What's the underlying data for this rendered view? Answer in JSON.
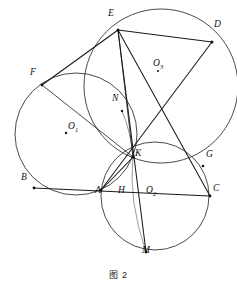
{
  "figure": {
    "caption": "图 2",
    "width": 237,
    "height": 289,
    "background_color": "#ffffff",
    "stroke_color": "#1a1a1a",
    "circle_stroke_color": "#2b2b2b"
  },
  "circles": [
    {
      "name": "O1",
      "label": "O",
      "subscript": "1",
      "cx": 76,
      "cy": 134,
      "r": 61,
      "label_x": 68,
      "label_y": 129,
      "has_center_dot": true
    },
    {
      "name": "O2",
      "label": "O",
      "subscript": "2",
      "cx": 155,
      "cy": 196,
      "r": 54,
      "label_x": 146,
      "label_y": 193,
      "has_center_dot": false
    },
    {
      "name": "O3",
      "label": "O",
      "subscript": "3",
      "cx": 161,
      "cy": 86,
      "r": 77,
      "label_x": 153,
      "label_y": 66,
      "has_center_dot": false
    }
  ],
  "points": [
    {
      "name": "E",
      "label": "E",
      "x": 118,
      "y": 30,
      "label_x": 108,
      "label_y": 17
    },
    {
      "name": "D",
      "label": "D",
      "x": 212,
      "y": 42,
      "label_x": 214,
      "label_y": 28
    },
    {
      "name": "F",
      "label": "F",
      "x": 42,
      "y": 85,
      "label_x": 30,
      "label_y": 76
    },
    {
      "name": "N",
      "label": "N",
      "x": 122,
      "y": 111,
      "label_x": 112,
      "label_y": 102
    },
    {
      "name": "K",
      "label": "K",
      "x": 133,
      "y": 157,
      "label_x": 135,
      "label_y": 157
    },
    {
      "name": "G",
      "label": "G",
      "x": 203,
      "y": 166,
      "label_x": 206,
      "label_y": 158
    },
    {
      "name": "B",
      "label": "B",
      "x": 34,
      "y": 188,
      "label_x": 21,
      "label_y": 181
    },
    {
      "name": "A",
      "label": "A",
      "x": 101,
      "y": 190,
      "label_x": 95,
      "label_y": 194
    },
    {
      "name": "H",
      "label": "H",
      "x": 122,
      "y": 192,
      "label_x": 118,
      "label_y": 194
    },
    {
      "name": "C",
      "label": "C",
      "x": 210,
      "y": 196,
      "label_x": 213,
      "label_y": 192
    },
    {
      "name": "M",
      "label": "M",
      "x": 146,
      "y": 252,
      "label_x": 142,
      "label_y": 254
    }
  ],
  "segments": [
    {
      "name": "segment-F-E",
      "from": "F",
      "to": "E"
    },
    {
      "name": "segment-E-D",
      "from": "E",
      "to": "D"
    },
    {
      "name": "segment-E-M",
      "from": "E",
      "to": "M"
    },
    {
      "name": "segment-E-C",
      "from": "E",
      "to": "C"
    },
    {
      "name": "segment-E-K",
      "from": "E",
      "to": "K"
    },
    {
      "name": "segment-D-A",
      "from": "D",
      "to": "A"
    },
    {
      "name": "segment-B-C",
      "from": "B",
      "to": "C"
    },
    {
      "name": "segment-F-K",
      "from": "F",
      "to": "K"
    },
    {
      "name": "segment-A-K",
      "from": "A",
      "to": "K"
    },
    {
      "name": "segment-B-A",
      "from": "B",
      "to": "A"
    }
  ],
  "marks": {
    "vertex_dot_radius": 1.4,
    "center_dot_radius": 1.2
  }
}
